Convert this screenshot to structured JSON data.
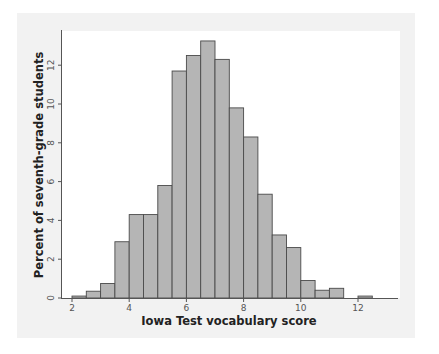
{
  "chart_data": {
    "type": "bar",
    "subtype": "histogram",
    "title": "",
    "xlabel": "Iowa Test vocabulary score",
    "ylabel": "Percent of seventh-grade students",
    "bin_width": 0.5,
    "bins": [
      {
        "start": 2.0,
        "end": 2.5,
        "value": 0.1
      },
      {
        "start": 2.5,
        "end": 3.0,
        "value": 0.35
      },
      {
        "start": 3.0,
        "end": 3.5,
        "value": 0.75
      },
      {
        "start": 3.5,
        "end": 4.0,
        "value": 2.9
      },
      {
        "start": 4.0,
        "end": 4.5,
        "value": 4.3
      },
      {
        "start": 4.5,
        "end": 5.0,
        "value": 4.3
      },
      {
        "start": 5.0,
        "end": 5.5,
        "value": 5.8
      },
      {
        "start": 5.5,
        "end": 6.0,
        "value": 11.7
      },
      {
        "start": 6.0,
        "end": 6.5,
        "value": 12.5
      },
      {
        "start": 6.5,
        "end": 7.0,
        "value": 13.25
      },
      {
        "start": 7.0,
        "end": 7.5,
        "value": 12.3
      },
      {
        "start": 7.5,
        "end": 8.0,
        "value": 9.8
      },
      {
        "start": 8.0,
        "end": 8.5,
        "value": 8.3
      },
      {
        "start": 8.5,
        "end": 9.0,
        "value": 5.35
      },
      {
        "start": 9.0,
        "end": 9.5,
        "value": 3.25
      },
      {
        "start": 9.5,
        "end": 10.0,
        "value": 2.6
      },
      {
        "start": 10.0,
        "end": 10.5,
        "value": 0.9
      },
      {
        "start": 10.5,
        "end": 11.0,
        "value": 0.4
      },
      {
        "start": 11.0,
        "end": 11.5,
        "value": 0.5
      },
      {
        "start": 11.5,
        "end": 12.0,
        "value": 0.0
      },
      {
        "start": 12.0,
        "end": 12.5,
        "value": 0.1
      }
    ],
    "x_ticks": [
      2,
      4,
      6,
      8,
      10,
      12
    ],
    "y_ticks": [
      0,
      2,
      4,
      6,
      8,
      10,
      12
    ],
    "xlim": [
      1.6,
      13.3
    ],
    "ylim": [
      0,
      13.8
    ],
    "grid": false,
    "legend": null,
    "colors": {
      "bar_fill": "#b5b5b5",
      "bar_edge": "#4a4a4a",
      "axis": "#555555",
      "frame_bg": "#f2f2f2",
      "plot_bg": "#ffffff"
    }
  }
}
